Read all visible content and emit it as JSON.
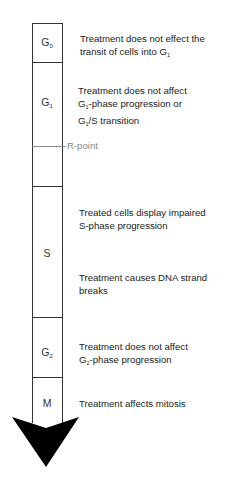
{
  "diagram": {
    "phases": [
      {
        "id": "G0",
        "base": "G",
        "sub": "0"
      },
      {
        "id": "G1",
        "base": "G",
        "sub": "1"
      },
      {
        "id": "S",
        "base": "S",
        "sub": ""
      },
      {
        "id": "G2",
        "base": "G",
        "sub": "2"
      },
      {
        "id": "M",
        "base": "M",
        "sub": ""
      }
    ],
    "checkpoint": {
      "label": "R-point"
    },
    "annotations": {
      "g0": {
        "line1": "Treatment does not effect the",
        "line2_pre": "transit of cells into G",
        "line2_sub": "1"
      },
      "g1": {
        "line1": "Treatment does not affect",
        "line2_pre": "G",
        "line2_sub": "1",
        "line2_post": "-phase progression or",
        "line3_pre": "G",
        "line3_sub": "1",
        "line3_post": "/S transition"
      },
      "s1": {
        "line1": "Treated cells display impaired",
        "line2": "S-phase progression"
      },
      "s2": {
        "line1": "Treatment causes DNA strand",
        "line2": "breaks"
      },
      "g2": {
        "line1": "Treatment does not affect",
        "line2_pre": "G",
        "line2_sub": "2",
        "line2_post": "-phase progression"
      },
      "m": {
        "line1": "Treatment affects mitosis"
      }
    },
    "colors": {
      "line": "#333333",
      "rpoint": "#888888",
      "arrow": "#000000",
      "text": "#222222"
    }
  }
}
